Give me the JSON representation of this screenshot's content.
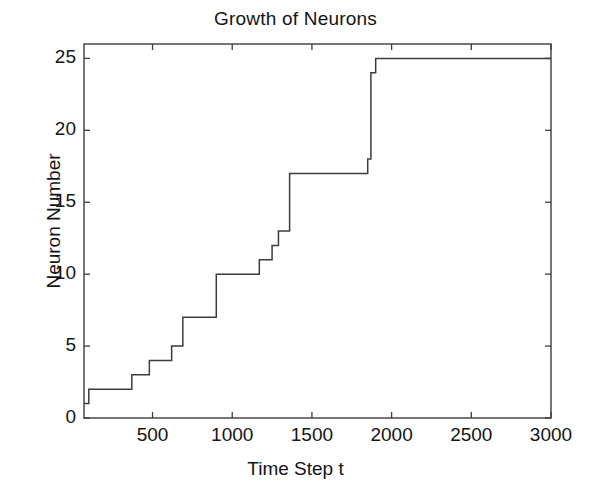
{
  "chart_data": {
    "type": "line",
    "title": "Growth of Neurons",
    "xlabel": "Time Step t",
    "ylabel": "Neuron Number",
    "xlim": [
      70,
      3000
    ],
    "ylim": [
      0,
      26
    ],
    "grid": false,
    "legend": null,
    "line_color": "#3c3c3c",
    "step_style": "post",
    "xticks": [
      500,
      1000,
      1500,
      2000,
      2500,
      3000
    ],
    "xticklabels": [
      "500",
      "1000",
      "1500",
      "2000",
      "2500",
      "3000"
    ],
    "yticks": [
      0,
      5,
      10,
      15,
      20,
      25
    ],
    "yticklabels": [
      "0",
      "5",
      "10",
      "15",
      "20",
      "25"
    ],
    "x": [
      70,
      100,
      370,
      480,
      620,
      690,
      900,
      930,
      1170,
      1250,
      1290,
      1360,
      1400,
      1560,
      1850,
      1870,
      1900,
      3000
    ],
    "y": [
      1,
      2,
      3,
      4,
      5,
      7,
      7,
      10,
      10,
      11,
      12,
      13,
      17,
      17,
      18,
      24,
      25,
      25
    ],
    "series": [
      {
        "name": "Neuron Number",
        "points": [
          {
            "t": 70,
            "n": 1
          },
          {
            "t": 100,
            "n": 2
          },
          {
            "t": 370,
            "n": 3
          },
          {
            "t": 480,
            "n": 4
          },
          {
            "t": 620,
            "n": 5
          },
          {
            "t": 690,
            "n": 7
          },
          {
            "t": 900,
            "n": 10
          },
          {
            "t": 1170,
            "n": 11
          },
          {
            "t": 1250,
            "n": 12
          },
          {
            "t": 1290,
            "n": 13
          },
          {
            "t": 1360,
            "n": 17
          },
          {
            "t": 1850,
            "n": 18
          },
          {
            "t": 1870,
            "n": 24
          },
          {
            "t": 1900,
            "n": 25
          },
          {
            "t": 3000,
            "n": 25
          }
        ]
      }
    ]
  },
  "figure": {
    "title": "Growth of Neurons",
    "xlabel": "Time Step t",
    "ylabel": "Neuron Number"
  }
}
